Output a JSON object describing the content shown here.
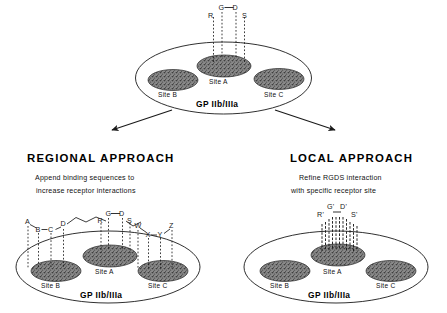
{
  "figure": {
    "type": "scientific-diagram",
    "background": "#ffffff",
    "ink": "#1a1a1a",
    "site_fill": "#6e6e6e"
  },
  "top_panel": {
    "name": "native-rgds-panel",
    "receptor_label": "GP IIb/IIIa",
    "sites": [
      {
        "label": "Site B"
      },
      {
        "label": "Site A"
      },
      {
        "label": "Site C"
      }
    ],
    "ligand": {
      "name": "RGDS",
      "residues": [
        "R",
        "G",
        "D",
        "S"
      ],
      "bond_between": "G-D",
      "contacts": 4,
      "bound_site": "Site A"
    }
  },
  "branches": {
    "left_arrow": "arrow-down-left",
    "right_arrow": "arrow-down-right"
  },
  "left_panel": {
    "name": "regional-approach",
    "heading": "REGIONAL  APPROACH",
    "subtitle_line1": "Append binding sequences to",
    "subtitle_line2": "increase receptor interactions",
    "receptor_label": "GP IIb/IIIa",
    "sites": [
      {
        "label": "Site B"
      },
      {
        "label": "Site A"
      },
      {
        "label": "Site C"
      }
    ],
    "ligand": {
      "name": "A-B-C-D linker RGDS linker W-X-Y-Z",
      "left_residues": [
        "A",
        "B",
        "C",
        "D"
      ],
      "core_residues": [
        "R",
        "G",
        "D",
        "S"
      ],
      "right_residues": [
        "W",
        "X",
        "Y",
        "Z"
      ],
      "core_bond_between": "G-D",
      "left_bonds": "B-C",
      "right_bonds": "X-Y",
      "contacts_left": 4,
      "contacts_core": 4,
      "contacts_right": 4,
      "bound_sites": [
        "Site B",
        "Site A",
        "Site C"
      ]
    }
  },
  "right_panel": {
    "name": "local-approach",
    "heading": "LOCAL  APPROACH",
    "subtitle_line1": "Refine RGDS interaction",
    "subtitle_line2": "with specific receptor site",
    "receptor_label": "GP IIb/IIIa",
    "sites": [
      {
        "label": "Site B"
      },
      {
        "label": "Site A"
      },
      {
        "label": "Site C"
      }
    ],
    "ligand": {
      "name": "R'-G'-D'-S'",
      "residues": [
        "R'",
        "G'",
        "D'",
        "S'"
      ],
      "bond_between": "G'-D'",
      "contacts": 11,
      "bound_site": "Site A"
    }
  }
}
